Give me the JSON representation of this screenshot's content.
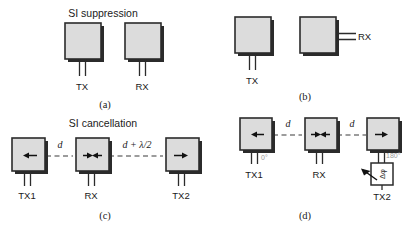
{
  "figure": {
    "background_color": "#ffffff",
    "patch_fill_color": "#dcdcdc",
    "outline_color": "#2b2b2b",
    "phase_label_color": "#9a9a9a"
  },
  "panels": {
    "a": {
      "caption": "(a)",
      "title": "SI suppression",
      "antennas": [
        {
          "label": "TX",
          "feed": "bottom",
          "arrow": "none"
        },
        {
          "label": "RX",
          "feed": "bottom",
          "arrow": "none"
        }
      ]
    },
    "b": {
      "caption": "(b)",
      "title": "",
      "antennas": [
        {
          "label": "TX",
          "feed": "bottom",
          "arrow": "none"
        },
        {
          "label": "RX",
          "feed": "right",
          "arrow": "none"
        }
      ]
    },
    "c": {
      "caption": "(c)",
      "title": "SI cancellation",
      "antennas": [
        {
          "label": "TX1",
          "feed": "bottom",
          "arrow": "left"
        },
        {
          "label": "RX",
          "feed": "bottom",
          "arrow": "double-inward"
        },
        {
          "label": "TX2",
          "feed": "bottom",
          "arrow": "right"
        }
      ],
      "distances": [
        "d",
        "d + λ/2"
      ]
    },
    "d": {
      "caption": "(d)",
      "title": "",
      "antennas": [
        {
          "label": "TX1",
          "feed": "bottom",
          "arrow": "left",
          "phase": "0°"
        },
        {
          "label": "RX",
          "feed": "bottom",
          "arrow": "double-inward",
          "phase": ""
        },
        {
          "label": "TX2",
          "feed": "bottom",
          "arrow": "right",
          "phase": "180°"
        }
      ],
      "distances": [
        "d",
        "d"
      ],
      "phase_shifter": {
        "symbol": "Δφ",
        "name": "variable-phase-shifter"
      }
    }
  }
}
